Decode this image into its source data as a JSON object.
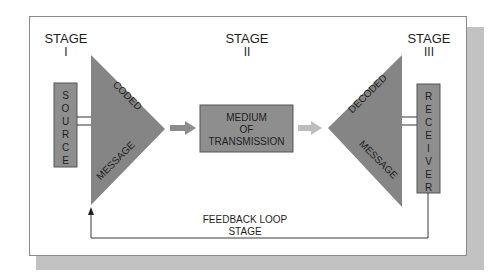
{
  "colors": {
    "box_fill": "#8e8e8e",
    "triangle_fill": "#858585",
    "arrow_dark": "#8c8c8c",
    "arrow_light": "#bdbdbd",
    "shadow": "#c2c2c2",
    "line": "#3a3a3a"
  },
  "stages": [
    {
      "title": "STAGE",
      "numeral": "I"
    },
    {
      "title": "STAGE",
      "numeral": "II"
    },
    {
      "title": "STAGE",
      "numeral": "III"
    }
  ],
  "source": {
    "letters": [
      "S",
      "O",
      "U",
      "R",
      "C",
      "E"
    ]
  },
  "receiver": {
    "letters": [
      "R",
      "E",
      "C",
      "E",
      "I",
      "V",
      "E",
      "R"
    ]
  },
  "coded_triangle": {
    "top_label": "CODED",
    "bottom_label": "MESSAGE"
  },
  "decoded_triangle": {
    "top_label": "DECODED",
    "bottom_label": "MESSAGE"
  },
  "medium": {
    "lines": [
      "MEDIUM",
      "OF",
      "TRANSMISSION"
    ]
  },
  "feedback": {
    "lines": [
      "FEEDBACK LOOP",
      "STAGE"
    ]
  }
}
